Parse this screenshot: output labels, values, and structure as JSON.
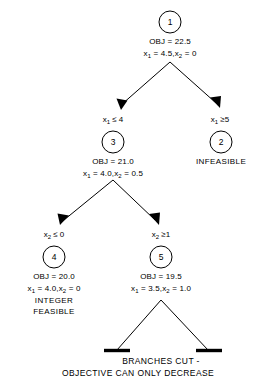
{
  "diagram": {
    "colors": {
      "background": "#ffffff",
      "ink": "#000000"
    },
    "nodes": [
      {
        "id": "1",
        "number": "1",
        "obj": "OBJ = 22.5",
        "vars_x1_label": "x",
        "vars_x1_sub": "1",
        "vars_x1_value": " = 4.5,",
        "vars_x2_label": "x",
        "vars_x2_sub": "2",
        "vars_x2_value": " = 0",
        "status": ""
      },
      {
        "id": "3",
        "number": "3",
        "obj": "OBJ = 21.0",
        "vars_x1_label": "x",
        "vars_x1_sub": "1",
        "vars_x1_value": " = 4.0,",
        "vars_x2_label": "x",
        "vars_x2_sub": "2",
        "vars_x2_value": " = 0.5",
        "status": ""
      },
      {
        "id": "2",
        "number": "2",
        "obj": "",
        "status": "INFEASIBLE"
      },
      {
        "id": "4",
        "number": "4",
        "obj": "OBJ = 20.0",
        "vars_x1_label": "x",
        "vars_x1_sub": "1",
        "vars_x1_value": " = 4.0,",
        "vars_x2_label": "x",
        "vars_x2_sub": "2",
        "vars_x2_value": " = 0",
        "status_line1": "INTEGER",
        "status_line2": "FEASIBLE"
      },
      {
        "id": "5",
        "number": "5",
        "obj": "OBJ = 19.5",
        "vars_x1_label": "x",
        "vars_x1_sub": "1",
        "vars_x1_value": " = 3.5,",
        "vars_x2_label": "x",
        "vars_x2_sub": "2",
        "vars_x2_value": " = 1.0",
        "status": ""
      }
    ],
    "branch_labels": {
      "n1_left_var": "x",
      "n1_left_sub": "1",
      "n1_left_cond": " ≤ 4",
      "n1_right_var": "x",
      "n1_right_sub": "1",
      "n1_right_cond": " ≥5",
      "n3_left_var": "x",
      "n3_left_sub": "2",
      "n3_left_cond": " ≤ 0",
      "n3_right_var": "x",
      "n3_right_sub": "2",
      "n3_right_cond": " ≥1"
    },
    "footer": {
      "line1": "BRANCHES CUT -",
      "line2": "OBJECTIVE CAN ONLY DECREASE"
    }
  }
}
